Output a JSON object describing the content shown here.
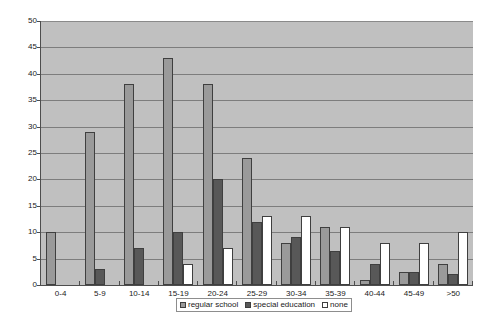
{
  "chart_data": {
    "type": "bar",
    "title": "",
    "subtitle": "",
    "xlabel": "",
    "ylabel": "",
    "ylim": [
      0,
      50
    ],
    "ytick_step": 5,
    "yticks": [
      0,
      5,
      10,
      15,
      20,
      25,
      30,
      35,
      40,
      45,
      50
    ],
    "ytick_labels": [
      "0",
      "5",
      "10",
      "15",
      "20",
      "25",
      "30",
      "35",
      "40",
      "45",
      "50"
    ],
    "grid": true,
    "grid_axis": "y",
    "legend_position": "bottom-center",
    "categories": [
      "0-4",
      "5-9",
      "10-14",
      "15-19",
      "20-24",
      "25-29",
      "30-34",
      "35-39",
      "40-44",
      "45-49",
      ">50"
    ],
    "series": [
      {
        "name": "regular school",
        "color": "#9a9a9a",
        "values": [
          10,
          29,
          38,
          43,
          38,
          24,
          8,
          11,
          1,
          2.5,
          4
        ]
      },
      {
        "name": "special education",
        "color": "#585858",
        "values": [
          0,
          3,
          7,
          10,
          20,
          12,
          9,
          6.5,
          4,
          2.5,
          2
        ]
      },
      {
        "name": "none",
        "color": "#ffffff",
        "values": [
          0,
          0,
          0,
          4,
          7,
          13,
          13,
          11,
          8,
          8,
          10
        ]
      }
    ]
  },
  "plot": {
    "background_color": "#c0c0c0",
    "gridline_color": "#7d7d7d",
    "axis_color": "#4d4d4d",
    "bar_border_color": "#3f3f3f"
  }
}
